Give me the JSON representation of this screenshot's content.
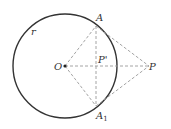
{
  "diagram": {
    "type": "geometry",
    "colors": {
      "circle": "#333333",
      "dashed": "#9a9a9a",
      "text": "#333333"
    },
    "circle": {
      "cx": 65,
      "cy": 66,
      "r": 52,
      "label": "r"
    },
    "points": {
      "O": {
        "x": 65,
        "y": 66,
        "label": "O"
      },
      "A": {
        "x": 96,
        "y": 26,
        "label": "A"
      },
      "A1": {
        "x": 96,
        "y": 106,
        "label": "A",
        "sub": "1"
      },
      "P": {
        "x": 149,
        "y": 66,
        "label": "P"
      },
      "Pprime": {
        "x": 96,
        "y": 66,
        "label": "P'"
      }
    },
    "segments": [
      "OA",
      "OA1",
      "OP",
      "AA1",
      "AP",
      "A1P"
    ]
  }
}
